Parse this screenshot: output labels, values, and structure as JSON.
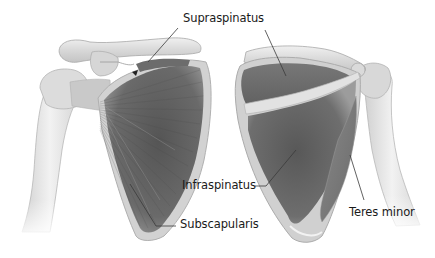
{
  "diagram": {
    "views": [
      {
        "name": "anterior",
        "description": "Front view of right scapula with humerus and clavicle"
      },
      {
        "name": "posterior",
        "description": "Back view of scapula with humerus"
      }
    ],
    "labels": [
      {
        "id": "supraspinatus",
        "text": "Supraspinatus",
        "x": 183,
        "y": 13
      },
      {
        "id": "infraspinatus",
        "text": "Infraspinatus",
        "x": 182,
        "y": 180
      },
      {
        "id": "subscapularis",
        "text": "Subscapularis",
        "x": 180,
        "y": 218
      },
      {
        "id": "teres-minor",
        "text": "Teres minor",
        "x": 349,
        "y": 207
      }
    ],
    "colors": {
      "background": "#ffffff",
      "muscle_dark": "#5a5a5a",
      "muscle_mid": "#7a7a7a",
      "bone_light": "#e4e4e4",
      "bone_shade": "#bdbdbd",
      "leader_line": "#3a3a3a",
      "text": "#1a1a1a"
    }
  }
}
